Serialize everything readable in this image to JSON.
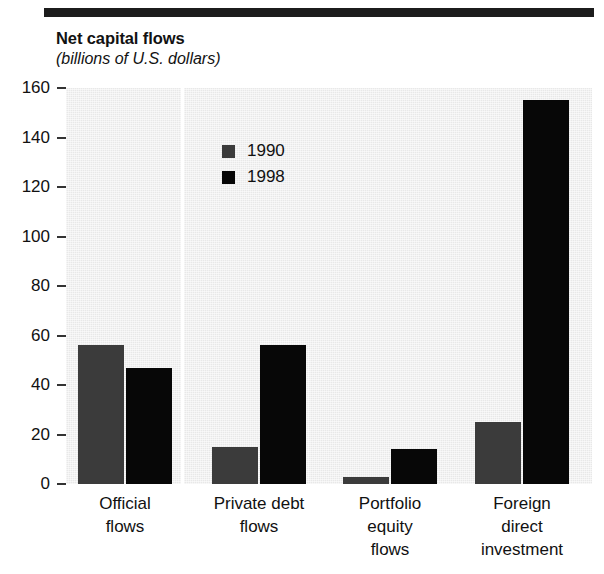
{
  "figure": {
    "title": "Net capital flows",
    "subtitle": "(billions of U.S. dollars)"
  },
  "legend": {
    "entries": [
      {
        "label": "1990",
        "color": "#3b3b3b"
      },
      {
        "label": "1998",
        "color": "#070707"
      }
    ]
  },
  "axis": {
    "y_ticks": [
      "160",
      "140",
      "120",
      "100",
      "80",
      "60",
      "40",
      "20",
      "0"
    ]
  },
  "categories": [
    {
      "line1": "Official",
      "line2": "flows",
      "line3": ""
    },
    {
      "line1": "Private debt",
      "line2": "flows",
      "line3": ""
    },
    {
      "line1": "Portfolio",
      "line2": "equity",
      "line3": "flows"
    },
    {
      "line1": "Foreign",
      "line2": "direct",
      "line3": "investment"
    }
  ],
  "chart_data": {
    "type": "bar",
    "title": "Net capital flows",
    "subtitle": "(billions of U.S. dollars)",
    "xlabel": "",
    "ylabel": "billions of U.S. dollars",
    "ylim": [
      0,
      160
    ],
    "ytick_step": 20,
    "grid": false,
    "legend_position": "inside-upper-left",
    "categories": [
      "Official flows",
      "Private debt flows",
      "Portfolio equity flows",
      "Foreign direct investment"
    ],
    "series": [
      {
        "name": "1990",
        "color": "#3b3b3b",
        "values": [
          56,
          15,
          3,
          25
        ]
      },
      {
        "name": "1998",
        "color": "#070707",
        "values": [
          47,
          56,
          14,
          155
        ]
      }
    ]
  }
}
